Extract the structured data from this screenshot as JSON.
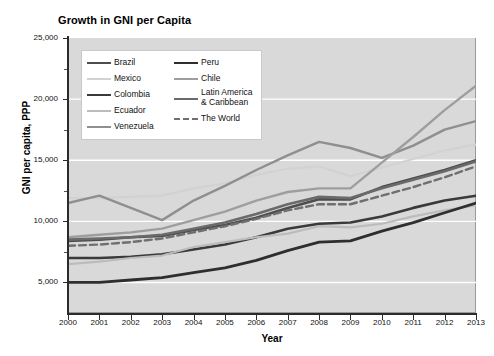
{
  "chart_data": {
    "type": "line",
    "title": "Growth in GNI per Capita",
    "xlabel": "Year",
    "ylabel": "GNI per capita, PPP",
    "grid": true,
    "legend_position": "upper-left-inside",
    "xlim": [
      2000,
      2013
    ],
    "ylim": [
      2500,
      25000
    ],
    "ytick_values": [
      5000,
      10000,
      15000,
      20000,
      25000
    ],
    "ytick_labels": [
      "5,000",
      "10,000",
      "15,000",
      "20,000",
      "25,000"
    ],
    "x": [
      2000,
      2001,
      2002,
      2003,
      2004,
      2005,
      2006,
      2007,
      2008,
      2009,
      2010,
      2011,
      2012,
      2013
    ],
    "xtick_labels": [
      "2000",
      "2001",
      "2002",
      "2003",
      "2004",
      "2005",
      "2006",
      "2007",
      "2008",
      "2009",
      "2010",
      "2011",
      "2012",
      "2013"
    ],
    "series": [
      {
        "name": "Brazil",
        "color": "#4d4d4d",
        "style": "solid",
        "width": 2.6,
        "values": [
          8400,
          8500,
          8700,
          8800,
          9300,
          9700,
          10300,
          11100,
          11800,
          11800,
          12800,
          13500,
          14200,
          15000
        ]
      },
      {
        "name": "Mexico",
        "color": "#d2d2d2",
        "style": "solid",
        "width": 2.2,
        "values": [
          11900,
          11900,
          12000,
          12100,
          12700,
          13100,
          13800,
          14300,
          14500,
          13700,
          14400,
          15100,
          15800,
          16300
        ]
      },
      {
        "name": "Colombia",
        "color": "#3a3a3a",
        "style": "solid",
        "width": 2.6,
        "values": [
          7000,
          7000,
          7100,
          7300,
          7700,
          8100,
          8700,
          9400,
          9800,
          9900,
          10400,
          11100,
          11700,
          12100
        ]
      },
      {
        "name": "Ecuador",
        "color": "#bcbcbc",
        "style": "solid",
        "width": 2.2,
        "values": [
          6500,
          6700,
          7000,
          7200,
          7900,
          8300,
          8700,
          9000,
          9600,
          9500,
          9800,
          10400,
          10900,
          11300
        ]
      },
      {
        "name": "Venezuela",
        "color": "#8f8f8f",
        "style": "solid",
        "width": 2.4,
        "values": [
          11500,
          12100,
          11100,
          10100,
          11700,
          12900,
          14200,
          15400,
          16500,
          16000,
          15200,
          16200,
          17500,
          18200
        ]
      },
      {
        "name": "Peru",
        "color": "#2e2e2e",
        "style": "solid",
        "width": 2.8,
        "values": [
          5000,
          5000,
          5200,
          5400,
          5800,
          6200,
          6800,
          7600,
          8300,
          8400,
          9200,
          9900,
          10700,
          11500
        ]
      },
      {
        "name": "Chile",
        "color": "#9e9e9e",
        "style": "solid",
        "width": 2.4,
        "values": [
          8700,
          8900,
          9100,
          9400,
          10100,
          10800,
          11700,
          12400,
          12700,
          12700,
          14800,
          16900,
          19100,
          21100
        ]
      },
      {
        "name": "Latin America & Caribbean",
        "color": "#6a6a6a",
        "style": "solid",
        "width": 2.6,
        "values": [
          8500,
          8600,
          8700,
          8900,
          9400,
          9900,
          10600,
          11400,
          12000,
          11900,
          12700,
          13400,
          14100,
          14900
        ]
      },
      {
        "name": "The World",
        "color": "#6f6f6f",
        "style": "dashed",
        "width": 2.4,
        "values": [
          8000,
          8100,
          8300,
          8600,
          9100,
          9600,
          10200,
          10900,
          11400,
          11400,
          12100,
          12800,
          13600,
          14500
        ]
      }
    ]
  },
  "legend": {
    "left_column": [
      {
        "label": "Brazil",
        "series": "Brazil"
      },
      {
        "label": "Mexico",
        "series": "Mexico"
      },
      {
        "label": "Colombia",
        "series": "Colombia"
      },
      {
        "label": "Ecuador",
        "series": "Ecuador"
      },
      {
        "label": "Venezuela",
        "series": "Venezuela"
      }
    ],
    "right_column": [
      {
        "label": "Peru",
        "series": "Peru"
      },
      {
        "label": "Chile",
        "series": "Chile"
      },
      {
        "label": "Latin America\n& Caribbean",
        "series": "Latin America & Caribbean"
      },
      {
        "label": "The World",
        "series": "The World"
      }
    ]
  },
  "colors": {
    "plot_background": "#d9d9d9",
    "gridline": "#ffffff",
    "axis": "#2b2b2b",
    "page_background": "#ffffff"
  }
}
